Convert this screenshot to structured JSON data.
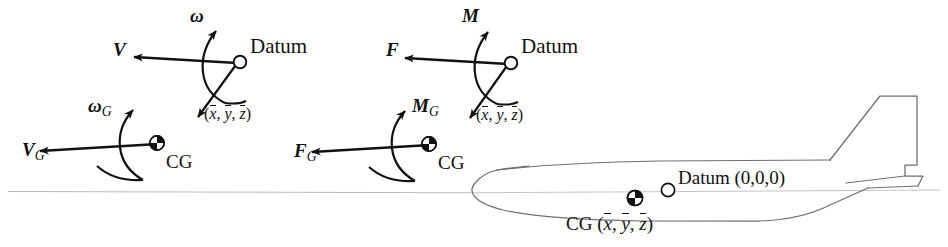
{
  "figure": {
    "background_color": "#ffffff",
    "ink_color": "#111111",
    "reference_line_color": "#b9b9b9",
    "outline_color": "#6f6f6f"
  },
  "panel_velocity": {
    "name": "velocity-diagram",
    "datum_label": "Datum",
    "cg_label": "CG",
    "offset_label": {
      "open": "(",
      "x": "x",
      "sep1": ", ",
      "y": "y",
      "sep2": ", ",
      "z": "z",
      "close": ")"
    },
    "vectors": [
      {
        "name": "omega",
        "symbol": "ω",
        "subscript": "",
        "kind": "curved-arrow",
        "at": "datum"
      },
      {
        "name": "V",
        "symbol": "V",
        "subscript": "",
        "kind": "straight-arrow",
        "at": "datum"
      },
      {
        "name": "omega-G",
        "symbol": "ω",
        "subscript": "G",
        "kind": "curved-arrow",
        "at": "cg"
      },
      {
        "name": "V-G",
        "symbol": "V",
        "subscript": "G",
        "kind": "straight-arrow",
        "at": "cg"
      }
    ]
  },
  "panel_force": {
    "name": "force-moment-diagram",
    "datum_label": "Datum",
    "cg_label": "CG",
    "offset_label": {
      "open": "(",
      "x": "x",
      "sep1": ", ",
      "y": "y",
      "sep2": ", ",
      "z": "z",
      "close": ")"
    },
    "vectors": [
      {
        "name": "M",
        "symbol": "M",
        "subscript": "",
        "kind": "curved-arrow",
        "at": "datum"
      },
      {
        "name": "F",
        "symbol": "F",
        "subscript": "",
        "kind": "straight-arrow",
        "at": "datum"
      },
      {
        "name": "M-G",
        "symbol": "M",
        "subscript": "G",
        "kind": "curved-arrow",
        "at": "cg"
      },
      {
        "name": "F-G",
        "symbol": "F",
        "subscript": "G",
        "kind": "straight-arrow",
        "at": "cg"
      }
    ]
  },
  "panel_aircraft": {
    "name": "aircraft-side-view",
    "datum_label": "Datum (0,0,0)",
    "cg_label_prefix": "CG ",
    "cg_coords": {
      "open": "(",
      "x": "x",
      "sep1": ", ",
      "y": "y",
      "sep2": ", ",
      "z": "z",
      "close": ")"
    },
    "markers": [
      {
        "name": "datum-marker",
        "style": "open-circle"
      },
      {
        "name": "cg-marker",
        "style": "quartered-circle"
      }
    ]
  }
}
